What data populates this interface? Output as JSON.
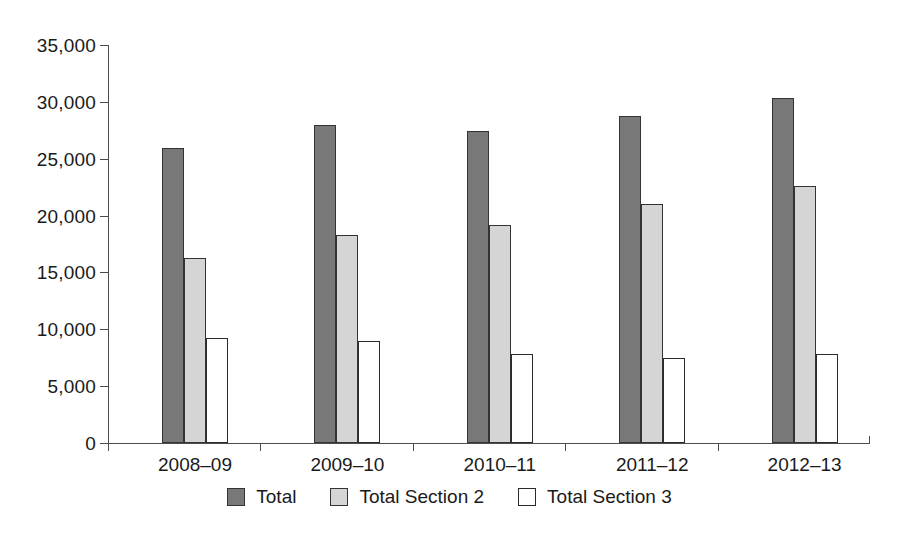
{
  "chart_data": {
    "type": "bar",
    "title": "",
    "subtitle": "",
    "xlabel": "",
    "ylabel": "",
    "categories": [
      "2008–09",
      "2009–10",
      "2010–11",
      "2011–12",
      "2012–13"
    ],
    "series": [
      {
        "name": "Total",
        "color": "#787878",
        "values": [
          25900,
          28000,
          27450,
          28750,
          30350
        ]
      },
      {
        "name": "Total Section 2",
        "color": "#d5d5d5",
        "values": [
          16300,
          18300,
          19150,
          21000,
          22600
        ]
      },
      {
        "name": "Total Section 3",
        "color": "#ffffff",
        "values": [
          9250,
          8950,
          7800,
          7500,
          7850
        ]
      }
    ],
    "ylim": [
      0,
      35000
    ],
    "ytick_values": [
      0,
      5000,
      10000,
      15000,
      20000,
      25000,
      30000,
      35000
    ],
    "ytick_labels": [
      "0",
      "5,000",
      "10,000",
      "15,000",
      "20,000",
      "25,000",
      "30,000",
      "35,000"
    ],
    "grid": false,
    "legend_position": "bottom",
    "legend_entries": [
      "Total",
      "Total Section 2",
      "Total Section 3"
    ],
    "annotations": []
  },
  "colors": {
    "axis": "#4d4d4d",
    "bar_outline": "#333333",
    "text": "#1a1a1a",
    "background": "#ffffff"
  }
}
